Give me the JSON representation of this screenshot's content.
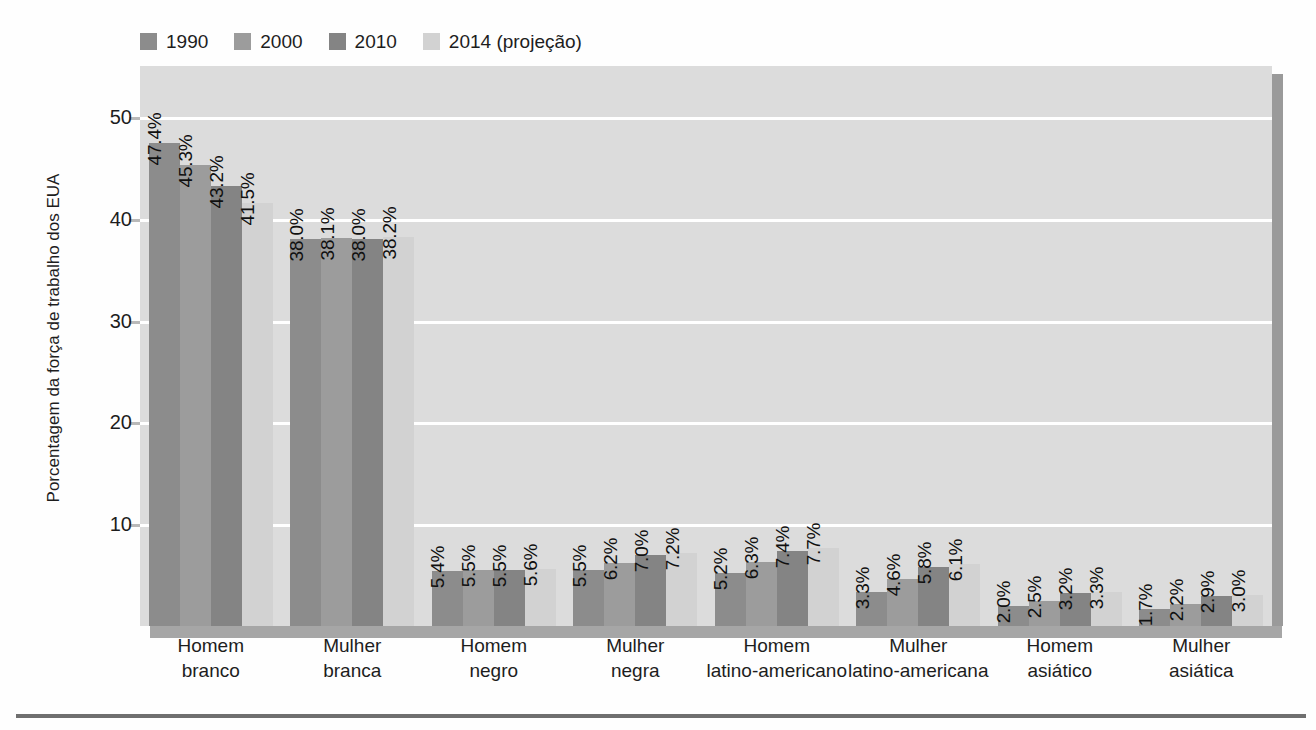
{
  "page": {
    "bleed_lines": [
      {
        "x": 430,
        "y": 66,
        "text": "a a qued  do  r n ent  m di no  dos tr b lh dor s"
      },
      {
        "x": 430,
        "y": 96,
        "text": "quest o da d sigua da e de gên ro e raç  no mercado"
      },
      {
        "x": 430,
        "y": 126,
        "text": "de trab lho  orte ment  se re aci na   s mud nças"
      },
      {
        "x": 430,
        "y": 156,
        "text": "demo rá ica  e ao  nível de  scol rid de  a popu"
      },
      {
        "x": 430,
        "y": 186,
        "text": "l ção  con mi am nte at va  os Est dos Un dos."
      },
      {
        "x": 430,
        "y": 266,
        "text": "As pro eçõe  in icam qu  a orç  de tr balho"
      },
      {
        "x": 430,
        "y": 296,
        "text": "segu rá m is dive sa   ara  pró ima  déc das. Um"
      },
      {
        "x": 430,
        "y": 326,
        "text": "nú ero ma or de mu here  e  e trab lhad res de"
      },
      {
        "x": 430,
        "y": 356,
        "text": "gru os min ri ár os dev  se  inte rar  o mer ado"
      },
      {
        "x": 430,
        "y": 436,
        "text": "Ess s dad s tam ém ap nta   ara a n cessi ade de"
      },
      {
        "x": 430,
        "y": 466,
        "text": "po íti as públ cas que a orde   que tão da equi"
      },
      {
        "x": 430,
        "y": 496,
        "text": "d de sal r al e de o ortun da es no a bi nte de"
      },
      {
        "x": 430,
        "y": 526,
        "text": "tra alho  arti ula es co  a edu ação."
      }
    ]
  },
  "chart_data": {
    "type": "bar",
    "title": "",
    "xlabel": "",
    "ylabel": "Porcentagem da força de trabalho dos EUA",
    "ylim": [
      0,
      55
    ],
    "yticks": [
      10,
      20,
      30,
      40,
      50
    ],
    "grid": true,
    "legend_position": "top-left",
    "value_label_suffix": "%",
    "categories": [
      [
        "Homem",
        "branco"
      ],
      [
        "Mulher",
        "branca"
      ],
      [
        "Homem",
        "negro"
      ],
      [
        "Mulher",
        "negra"
      ],
      [
        "Homem",
        "latino-americano"
      ],
      [
        "Mulher",
        "latino-americana"
      ],
      [
        "Homem",
        "asiático"
      ],
      [
        "Mulher",
        "asiática"
      ]
    ],
    "series": [
      {
        "name": "1990",
        "color": "#8c8c8c",
        "values": [
          47.4,
          38.0,
          5.4,
          5.5,
          5.2,
          3.3,
          2.0,
          1.7
        ],
        "labels": [
          "47.4%",
          "38.0%",
          "5.4%",
          "5.5%",
          "5.2%",
          "3.3%",
          "2.0%",
          "1.7%"
        ]
      },
      {
        "name": "2000",
        "color": "#9c9c9c",
        "values": [
          45.3,
          38.1,
          5.5,
          6.2,
          6.3,
          4.6,
          2.5,
          2.2
        ],
        "labels": [
          "45.3%",
          "38.1%",
          "5.5%",
          "6.2%",
          "6.3%",
          "4.6%",
          "2.5%",
          "2.2%"
        ]
      },
      {
        "name": "2010",
        "color": "#848484",
        "values": [
          43.2,
          38.0,
          5.5,
          7.0,
          7.4,
          5.8,
          3.2,
          2.9
        ],
        "labels": [
          "43.2%",
          "38.0%",
          "5.5%",
          "7.0%",
          "7.4%",
          "5.8%",
          "3.2%",
          "2.9%"
        ]
      },
      {
        "name": "2014 (projeção)",
        "color": "#d2d2d2",
        "values": [
          41.5,
          38.2,
          5.6,
          7.2,
          7.7,
          6.1,
          3.3,
          3.0
        ],
        "labels": [
          "41.5%",
          "38.2%",
          "5.6%",
          "7.2%",
          "7.7%",
          "6.1%",
          "3.3%",
          "3.0%"
        ]
      }
    ],
    "plot_background": "#dcdcdc",
    "gridline_color": "#ffffff"
  }
}
